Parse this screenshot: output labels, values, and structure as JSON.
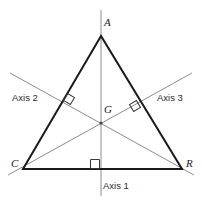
{
  "figure": {
    "kind": "geometry-diagram",
    "background_color": "#ffffff",
    "triangle": {
      "name": "triangle-ACR",
      "stroke_color": "#1a1a1a",
      "stroke_width": 2,
      "vertices": [
        {
          "label": "A",
          "x": 101,
          "y": 36,
          "label_x": 104,
          "label_y": 26
        },
        {
          "label": "C",
          "x": 23,
          "y": 169,
          "label_x": 11,
          "label_y": 167
        },
        {
          "label": "R",
          "x": 182,
          "y": 169,
          "label_x": 186,
          "label_y": 167
        }
      ]
    },
    "centroid": {
      "label": "G",
      "x": 101,
      "y": 123,
      "label_x": 104,
      "label_y": 113
    },
    "axes": [
      {
        "id": "axis-1",
        "label": "Axis 1",
        "label_x": 103,
        "label_y": 189,
        "color": "#8c8c8c",
        "stroke_width": 1,
        "x1": 101,
        "y1": 10,
        "x2": 101,
        "y2": 196
      },
      {
        "id": "axis-2",
        "label": "Axis 2",
        "label_x": 12,
        "label_y": 101,
        "color": "#8c8c8c",
        "stroke_width": 1,
        "x1": 10,
        "y1": 73,
        "x2": 194,
        "y2": 175
      },
      {
        "id": "axis-3",
        "label": "Axis 3",
        "label_x": 157,
        "label_y": 101,
        "color": "#8c8c8c",
        "stroke_width": 1,
        "x1": 192,
        "y1": 73,
        "x2": 8,
        "y2": 175
      }
    ],
    "right_angle_marks": [
      {
        "id": "right-angle-side-AC",
        "cx": 69,
        "cy": 99,
        "size": 8,
        "rotation": 31,
        "color": "#3a3a3a"
      },
      {
        "id": "right-angle-side-AR",
        "cx": 135,
        "cy": 106,
        "size": 8,
        "rotation": -31,
        "color": "#3a3a3a"
      },
      {
        "id": "right-angle-base-CR",
        "cx": 95,
        "cy": 164,
        "size": 9,
        "rotation": 0,
        "color": "#3a3a3a"
      }
    ]
  }
}
